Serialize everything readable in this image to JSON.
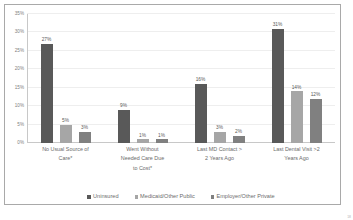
{
  "slide": {
    "page_number": "18"
  },
  "chart_data": {
    "type": "bar",
    "title": "",
    "subtitle": "",
    "xlabel": "",
    "ylabel": "",
    "ylim": [
      0,
      35
    ],
    "ytick_labels": [
      "0%",
      "5%",
      "10%",
      "15%",
      "20%",
      "25%",
      "30%",
      "35%"
    ],
    "ytick_values": [
      0,
      5,
      10,
      15,
      20,
      25,
      30,
      35
    ],
    "grid": true,
    "legend_position": "bottom",
    "categories": [
      "No Usual Source of Care*",
      "Went Without Needed Care Due to Cost*",
      "Last MD Contact > 2 Years Ago",
      "Last Dental Visit >2 Years Ago"
    ],
    "category_lines": [
      [
        "No Usual Source of",
        "Care*"
      ],
      [
        "Went Without",
        "Needed Care Due",
        "to Cost*"
      ],
      [
        "Last MD Contact >",
        "2 Years Ago"
      ],
      [
        "Last Dental Visit >2",
        "Years Ago"
      ]
    ],
    "series": [
      {
        "name": "Uninsured",
        "color": "#595959",
        "values": [
          27,
          9,
          16,
          31
        ],
        "labels": [
          "27%",
          "9%",
          "16%",
          "31%"
        ]
      },
      {
        "name": "Medicaid/Other Public",
        "color": "#a6a6a6",
        "values": [
          5,
          1,
          3,
          14
        ],
        "labels": [
          "5%",
          "1%",
          "3%",
          "14%"
        ]
      },
      {
        "name": "Employer/Other Private",
        "color": "#808080",
        "values": [
          3,
          1,
          2,
          12
        ],
        "labels": [
          "3%",
          "1%",
          "2%",
          "12%"
        ]
      }
    ]
  }
}
